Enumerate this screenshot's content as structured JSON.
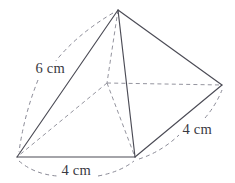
{
  "figure": {
    "kind": "square-pyramid-net-diagram",
    "stroke_color_visible": "#4b4b55",
    "stroke_color_hidden": "#8e8e99",
    "background_color": "#ffffff",
    "text_color": "#3a3a42"
  },
  "vertices": {
    "apex": {
      "name": "apex",
      "x": 118,
      "y": 10
    },
    "base_left": {
      "name": "base-front-left",
      "x": 17,
      "y": 157
    },
    "base_front": {
      "name": "base-front-right",
      "x": 135,
      "y": 157
    },
    "base_right": {
      "name": "base-back-right",
      "x": 222,
      "y": 85
    },
    "base_back": {
      "name": "base-back-left",
      "x": 107,
      "y": 83
    }
  },
  "edges": {
    "visible": [
      "apex-base_left",
      "apex-base_front",
      "apex-base_right",
      "base_left-base_front",
      "base_front-base_right"
    ],
    "hidden": [
      "apex-base_back",
      "base_back-base_left",
      "base_back-base_front",
      "base_back-base_right"
    ]
  },
  "dimensions": [
    {
      "id": "slant-edge",
      "label": "6 cm",
      "value": 6,
      "unit": "cm",
      "measures": "apex-base_left",
      "label_x": 34,
      "label_y": 61
    },
    {
      "id": "base-front-edge",
      "label": "4 cm",
      "value": 4,
      "unit": "cm",
      "measures": "base_left-base_front",
      "label_x": 60,
      "label_y": 163
    },
    {
      "id": "base-side-edge",
      "label": "4 cm",
      "value": 4,
      "unit": "cm",
      "measures": "base_front-base_right",
      "label_x": 181,
      "label_y": 122
    }
  ]
}
